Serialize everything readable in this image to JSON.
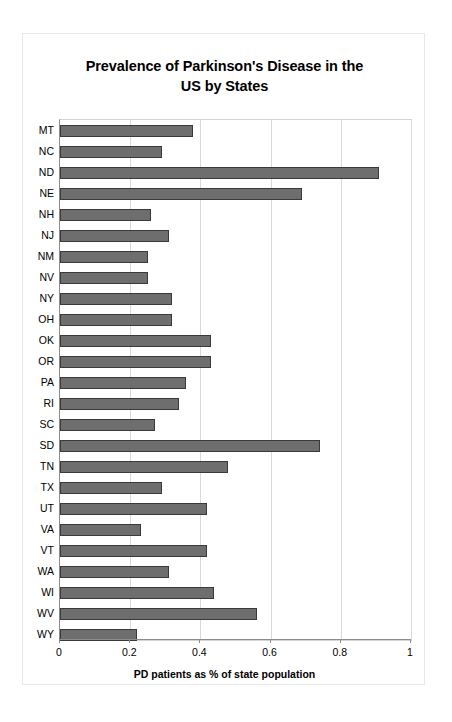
{
  "chart_data": {
    "type": "bar",
    "orientation": "horizontal",
    "title": "Prevalence of Parkinson's Disease in the US by States",
    "title_lines": [
      "Prevalence of Parkinson's Disease in the",
      "US by States"
    ],
    "xlabel": "PD patients as % of state population",
    "ylabel": "",
    "xlim": [
      0,
      1
    ],
    "xticks": [
      "0",
      "0.2",
      "0.4",
      "0.6",
      "0.8",
      "1"
    ],
    "xtick_values": [
      0,
      0.2,
      0.4,
      0.6,
      0.8,
      1
    ],
    "grid": "vertical",
    "legend": "none",
    "bar_color": "#6e6e6e",
    "bar_edge_color": "#3a3a3a",
    "categories": [
      "MT",
      "NC",
      "ND",
      "NE",
      "NH",
      "NJ",
      "NM",
      "NV",
      "NY",
      "OH",
      "OK",
      "OR",
      "PA",
      "RI",
      "SC",
      "SD",
      "TN",
      "TX",
      "UT",
      "VA",
      "VT",
      "WA",
      "WI",
      "WV",
      "WY"
    ],
    "values": [
      0.38,
      0.29,
      0.91,
      0.69,
      0.26,
      0.31,
      0.25,
      0.25,
      0.32,
      0.32,
      0.43,
      0.43,
      0.36,
      0.34,
      0.27,
      0.74,
      0.48,
      0.29,
      0.42,
      0.23,
      0.42,
      0.31,
      0.44,
      0.56,
      0.22
    ]
  }
}
